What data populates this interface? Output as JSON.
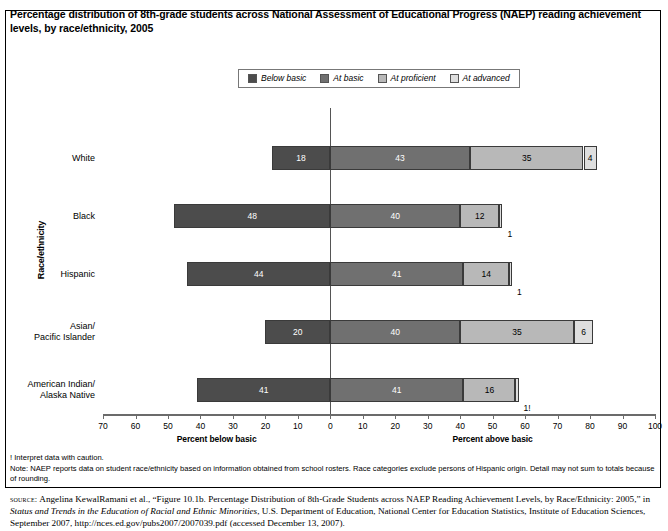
{
  "chart_title": "Percentage distribution of 8th-grade students across National Assessment of Educational Progress (NAEP) reading achievement levels, by race/ethnicity, 2005",
  "legend": {
    "items": [
      {
        "label": "Below basic",
        "color": "#4c4c4c",
        "key": "below"
      },
      {
        "label": "At basic",
        "color": "#707070",
        "key": "basic"
      },
      {
        "label": "At proficient",
        "color": "#b8b8b8",
        "key": "prof"
      },
      {
        "label": "At advanced",
        "color": "#dedede",
        "key": "adv"
      }
    ]
  },
  "axes": {
    "y_title": "Race/ethnicity",
    "x_left_caption": "Percent below basic",
    "x_right_caption": "Percent above basic",
    "x_ticks": [
      "70",
      "60",
      "50",
      "40",
      "30",
      "20",
      "10",
      "0",
      "10",
      "20",
      "30",
      "40",
      "50",
      "60",
      "70",
      "80",
      "90",
      "100"
    ],
    "x_left_max": 70,
    "x_right_max": 100
  },
  "notes": [
    "! Interpret data with caution.",
    "Note: NAEP reports data on student race/ethnicity based on information obtained from school rosters. Race categories exclude persons of Hispanic origin. Detail may not sum to totals because of rounding."
  ],
  "source": {
    "label": "source:",
    "text_1": " Angelina KewalRamani et al., “Figure 10.1b. Percentage Distribution of 8th-Grade Students across NAEP Reading Achievement Levels, by Race/Ethnicity: 2005,” in ",
    "italic_1": "Status and Trends in the Education of Racial and Ethnic Minorities",
    "text_2": ", U.S. Department of Education, National Center for Education Statistics, Institute of Education Sciences, September 2007, http://nces.ed.gov/pubs2007/2007039.pdf (accessed December 13, 2007)."
  },
  "chart_data": {
    "type": "bar",
    "title": "Percentage distribution of 8th-grade students across National Assessment of Educational Progress (NAEP) reading achievement levels, by race/ethnicity, 2005",
    "xlabel": "Percent below basic / Percent above basic",
    "ylabel": "Race/ethnicity",
    "orientation": "horizontal",
    "stacked": true,
    "diverging_at": 0,
    "xlim": [
      -70,
      100
    ],
    "grid": false,
    "legend_position": "top-center",
    "categories": [
      "White",
      "Black",
      "Hispanic",
      "Asian/Pacific Islander",
      "American Indian/Alaska Native"
    ],
    "series": [
      {
        "name": "Below basic",
        "values": [
          18,
          48,
          44,
          20,
          41
        ]
      },
      {
        "name": "At basic",
        "values": [
          43,
          40,
          41,
          40,
          41
        ]
      },
      {
        "name": "At proficient",
        "values": [
          35,
          12,
          14,
          35,
          16
        ]
      },
      {
        "name": "At advanced",
        "values": [
          4,
          1,
          1,
          6,
          1
        ]
      }
    ],
    "rows": [
      {
        "category": "White",
        "category_lines": [
          "White"
        ],
        "below_basic": 18,
        "at_basic": 43,
        "at_proficient": 35,
        "at_advanced": 4,
        "advanced_label": "4",
        "advanced_outside": false
      },
      {
        "category": "Black",
        "category_lines": [
          "Black"
        ],
        "below_basic": 48,
        "at_basic": 40,
        "at_proficient": 12,
        "at_advanced": 1,
        "advanced_label": "1",
        "advanced_outside": true
      },
      {
        "category": "Hispanic",
        "category_lines": [
          "Hispanic"
        ],
        "below_basic": 44,
        "at_basic": 41,
        "at_proficient": 14,
        "at_advanced": 1,
        "advanced_label": "1",
        "advanced_outside": true
      },
      {
        "category": "Asian/Pacific Islander",
        "category_lines": [
          "Asian/",
          "Pacific Islander"
        ],
        "below_basic": 20,
        "at_basic": 40,
        "at_proficient": 35,
        "at_advanced": 6,
        "advanced_label": "6",
        "advanced_outside": false
      },
      {
        "category": "American Indian/Alaska Native",
        "category_lines": [
          "American Indian/",
          "Alaska Native"
        ],
        "below_basic": 41,
        "at_basic": 41,
        "at_proficient": 16,
        "at_advanced": 1,
        "advanced_label": "1!",
        "advanced_outside": true
      }
    ]
  }
}
